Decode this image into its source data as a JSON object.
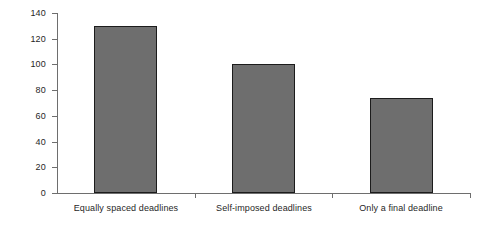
{
  "chart_data": {
    "type": "bar",
    "title": "",
    "xlabel": "",
    "ylabel": "",
    "categories": [
      "Equally spaced deadlines",
      "Self-imposed deadlines",
      "Only a final deadline"
    ],
    "values": [
      130,
      100,
      74
    ],
    "ylim": [
      0,
      140
    ],
    "ytick_labels": [
      "0",
      "20",
      "40",
      "60",
      "80",
      "100",
      "120",
      "140"
    ],
    "ytick_values": [
      0,
      20,
      40,
      60,
      80,
      100,
      120,
      140
    ],
    "grid": false,
    "legend": null,
    "bar_color": "#6e6e6e",
    "bar_border_color": "#1c1c1c",
    "axis_color": "#6e6e6e",
    "text_color": "#1f1f1f",
    "background": "#ffffff"
  },
  "axis": {
    "y_ticks": [
      {
        "label": "140",
        "value": 140
      },
      {
        "label": "120",
        "value": 120
      },
      {
        "label": "100",
        "value": 100
      },
      {
        "label": "80",
        "value": 80
      },
      {
        "label": "60",
        "value": 60
      },
      {
        "label": "40",
        "value": 40
      },
      {
        "label": "20",
        "value": 20
      },
      {
        "label": "0",
        "value": 0
      }
    ]
  },
  "bars": [
    {
      "label": "Equally spaced deadlines",
      "value": 130
    },
    {
      "label": "Self-imposed deadlines",
      "value": 100
    },
    {
      "label": "Only a final deadline",
      "value": 74
    }
  ]
}
